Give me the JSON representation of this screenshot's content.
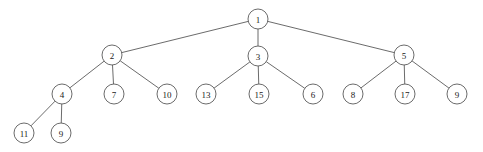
{
  "figure": {
    "kind": "rooted-tree-diagram",
    "background_color": "#ffffff",
    "stroke_color": "#5a5a5a",
    "label_color": "#1a1a1a",
    "node_fill": "#ffffff",
    "node_radius": 10
  },
  "chart_data": {
    "type": "diagram",
    "title": "",
    "nodes": [
      {
        "id": "n1",
        "label": "1",
        "x": 258,
        "y": 19,
        "depth": 0
      },
      {
        "id": "n2",
        "label": "2",
        "x": 112,
        "y": 55,
        "depth": 1
      },
      {
        "id": "n3",
        "label": "3",
        "x": 258,
        "y": 56,
        "depth": 1
      },
      {
        "id": "n5",
        "label": "5",
        "x": 404,
        "y": 55,
        "depth": 1
      },
      {
        "id": "n4",
        "label": "4",
        "x": 62,
        "y": 94,
        "depth": 2
      },
      {
        "id": "n7",
        "label": "7",
        "x": 114,
        "y": 94,
        "depth": 2
      },
      {
        "id": "n10",
        "label": "10",
        "x": 167,
        "y": 94,
        "depth": 2
      },
      {
        "id": "n13",
        "label": "13",
        "x": 206,
        "y": 94,
        "depth": 2
      },
      {
        "id": "n15",
        "label": "15",
        "x": 259,
        "y": 94,
        "depth": 2
      },
      {
        "id": "n6",
        "label": "6",
        "x": 313,
        "y": 94,
        "depth": 2
      },
      {
        "id": "n8",
        "label": "8",
        "x": 353,
        "y": 94,
        "depth": 2
      },
      {
        "id": "n17",
        "label": "17",
        "x": 405,
        "y": 94,
        "depth": 2
      },
      {
        "id": "n9",
        "label": "9",
        "x": 457,
        "y": 94,
        "depth": 2
      },
      {
        "id": "n11",
        "label": "11",
        "x": 24,
        "y": 133,
        "depth": 3
      },
      {
        "id": "n9b",
        "label": "9",
        "x": 61,
        "y": 133,
        "depth": 3
      }
    ],
    "edges": [
      {
        "from": "n1",
        "to": "n2"
      },
      {
        "from": "n1",
        "to": "n3"
      },
      {
        "from": "n1",
        "to": "n5"
      },
      {
        "from": "n2",
        "to": "n4"
      },
      {
        "from": "n2",
        "to": "n7"
      },
      {
        "from": "n2",
        "to": "n10"
      },
      {
        "from": "n3",
        "to": "n13"
      },
      {
        "from": "n3",
        "to": "n15"
      },
      {
        "from": "n3",
        "to": "n6"
      },
      {
        "from": "n5",
        "to": "n8"
      },
      {
        "from": "n5",
        "to": "n17"
      },
      {
        "from": "n5",
        "to": "n9"
      },
      {
        "from": "n4",
        "to": "n11"
      },
      {
        "from": "n4",
        "to": "n9b"
      }
    ]
  }
}
